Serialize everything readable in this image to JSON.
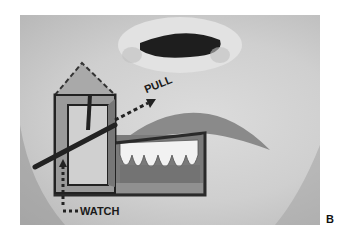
{
  "figure": {
    "letter": "B"
  },
  "annotations": {
    "pull": "PULL",
    "watch": "WATCH"
  },
  "colors": {
    "background": "#ffffff",
    "skin": "#d4d4d4",
    "overlay_fill": "#a8a8a8",
    "outline": "#2a2a2a"
  }
}
